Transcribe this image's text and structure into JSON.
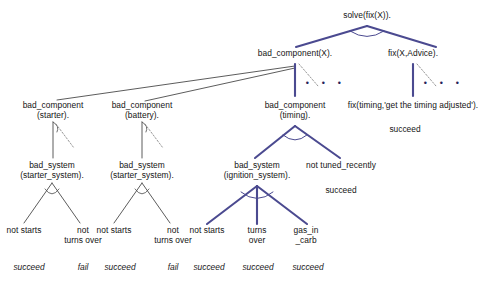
{
  "figure": {
    "type": "proof-tree",
    "colors": {
      "thick_edge": "#4b4a90",
      "thin_edge": "#4a4a4a",
      "dashed_edge": "#8a8a8a",
      "text": "#141414",
      "background": "#ffffff"
    }
  },
  "nodes": {
    "root": {
      "label": "solve(fix(X))."
    },
    "bad_component_X": {
      "label": "bad_component(X)."
    },
    "fix_X_Advice": {
      "label": "fix(X,Advice)."
    },
    "bad_component_starter": {
      "label": "bad_component\n(starter)."
    },
    "bad_component_battery": {
      "label": "bad_component\n(battery)."
    },
    "bad_component_timing": {
      "label": "bad_component\n(timing)."
    },
    "fix_timing": {
      "label": "fix(timing,'get the timing adjusted')."
    },
    "fix_timing_result": {
      "label": "succeed"
    },
    "bad_system_starter_1": {
      "label": "bad_system\n(starter_system)."
    },
    "bad_system_starter_2": {
      "label": "bad_system\n(starter_system)."
    },
    "bad_system_ignition": {
      "label": "bad_system\n(ignition_system)."
    },
    "not_tuned_recently": {
      "label": "not tuned_recently"
    },
    "not_tuned_recently_result": {
      "label": "succeed"
    }
  },
  "leaves": [
    {
      "id": "leaf-1",
      "label": "not starts",
      "result": "succeed"
    },
    {
      "id": "leaf-2",
      "label": "not\nturns over",
      "result": "fail"
    },
    {
      "id": "leaf-3",
      "label": "not starts",
      "result": "succeed"
    },
    {
      "id": "leaf-4",
      "label": "not\nturns over",
      "result": "fail"
    },
    {
      "id": "leaf-5",
      "label": "not starts",
      "result": "succeed"
    },
    {
      "id": "leaf-6",
      "label": "turns\nover",
      "result": "succeed"
    },
    {
      "id": "leaf-7",
      "label": "gas_in\n_carb",
      "result": "succeed"
    }
  ],
  "ellipses": [
    {
      "id": "ellipsis-bad-component",
      "label": "•  •  •"
    },
    {
      "id": "ellipsis-fix",
      "label": "•  •  •"
    }
  ],
  "caption": {
    "text": ""
  }
}
